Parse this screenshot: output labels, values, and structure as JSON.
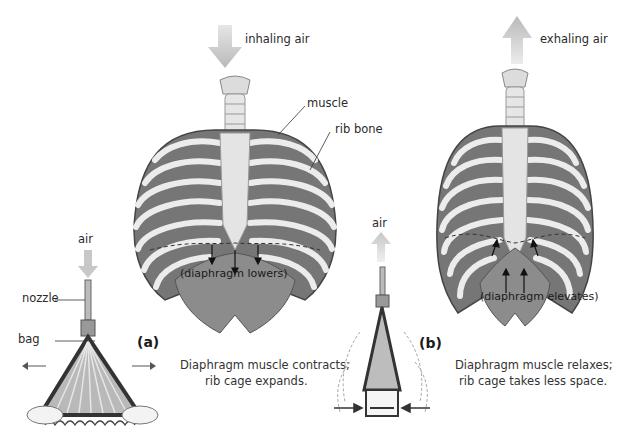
{
  "figure": {
    "panel_a": {
      "tag": "(a)",
      "caption_line1": "Diaphragm muscle contracts;",
      "caption_line2": "rib cage expands.",
      "airflow_label": "inhaling air",
      "ribcage_labels": {
        "muscle": "muscle",
        "rib_bone": "rib bone",
        "diaphragm": "(diaphragm lowers)"
      },
      "bag_model": {
        "air_label": "air",
        "nozzle_label": "nozzle",
        "bag_label": "bag"
      }
    },
    "panel_b": {
      "tag": "(b)",
      "caption_line1": "Diaphragm muscle relaxes;",
      "caption_line2": "rib cage takes less space.",
      "airflow_label": "exhaling air",
      "ribcage_labels": {
        "diaphragm": "(diaphragm elevates)"
      },
      "bag_model": {
        "air_label": "air"
      }
    },
    "colors": {
      "arrow_fill": "#c8c8c8",
      "rib_bone": "#ececec",
      "muscle": "#7a7a7a",
      "muscle_dark": "#5e5e5e",
      "diaphragm": "#8a8a8a",
      "sternum": "#e2e2e2"
    }
  }
}
